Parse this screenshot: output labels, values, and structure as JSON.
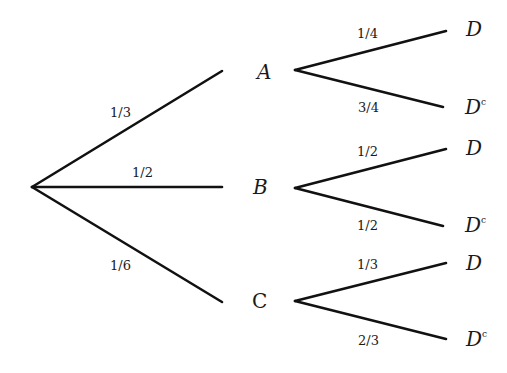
{
  "diagram": {
    "type": "probability-tree",
    "root": {
      "x": 32,
      "y": 187
    },
    "first_level": [
      {
        "id": "A",
        "label": "A",
        "prob": "1/3",
        "end": {
          "x": 222,
          "y": 71
        },
        "label_pos": {
          "x": 257,
          "y": 79
        },
        "prob_pos": {
          "x": 110,
          "y": 117
        },
        "children": [
          {
            "label": "D",
            "sup": "",
            "prob": "1/4",
            "from": {
              "x": 295,
              "y": 70
            },
            "end": {
              "x": 446,
              "y": 31
            },
            "label_pos": {
              "x": 466,
              "y": 36
            },
            "prob_pos": {
              "x": 357,
              "y": 38
            }
          },
          {
            "label": "D",
            "sup": "c",
            "prob": "3/4",
            "from": {
              "x": 295,
              "y": 70
            },
            "end": {
              "x": 443,
              "y": 107
            },
            "label_pos": {
              "x": 465,
              "y": 114
            },
            "prob_pos": {
              "x": 358,
              "y": 112
            }
          }
        ]
      },
      {
        "id": "B",
        "label": "B",
        "prob": "1/2",
        "end": {
          "x": 222,
          "y": 187
        },
        "label_pos": {
          "x": 253,
          "y": 194
        },
        "prob_pos": {
          "x": 132,
          "y": 177
        },
        "children": [
          {
            "label": "D",
            "sup": "",
            "prob": "1/2",
            "from": {
              "x": 295,
              "y": 188
            },
            "end": {
              "x": 446,
              "y": 149
            },
            "label_pos": {
              "x": 466,
              "y": 155
            },
            "prob_pos": {
              "x": 357,
              "y": 156
            }
          },
          {
            "label": "D",
            "sup": "c",
            "prob": "1/2",
            "from": {
              "x": 295,
              "y": 188
            },
            "end": {
              "x": 443,
              "y": 226
            },
            "label_pos": {
              "x": 465,
              "y": 232
            },
            "prob_pos": {
              "x": 357,
              "y": 230
            }
          }
        ]
      },
      {
        "id": "C",
        "label": "C",
        "prob": "1/6",
        "end": {
          "x": 222,
          "y": 302
        },
        "label_pos": {
          "x": 252,
          "y": 308
        },
        "prob_pos": {
          "x": 110,
          "y": 270
        },
        "children": [
          {
            "label": "D",
            "sup": "",
            "prob": "1/3",
            "from": {
              "x": 295,
              "y": 301
            },
            "end": {
              "x": 446,
              "y": 263
            },
            "label_pos": {
              "x": 466,
              "y": 270
            },
            "prob_pos": {
              "x": 357,
              "y": 269
            }
          },
          {
            "label": "D",
            "sup": "c",
            "prob": "2/3",
            "from": {
              "x": 295,
              "y": 301
            },
            "end": {
              "x": 446,
              "y": 339
            },
            "label_pos": {
              "x": 466,
              "y": 346
            },
            "prob_pos": {
              "x": 358,
              "y": 345
            }
          }
        ]
      }
    ]
  }
}
